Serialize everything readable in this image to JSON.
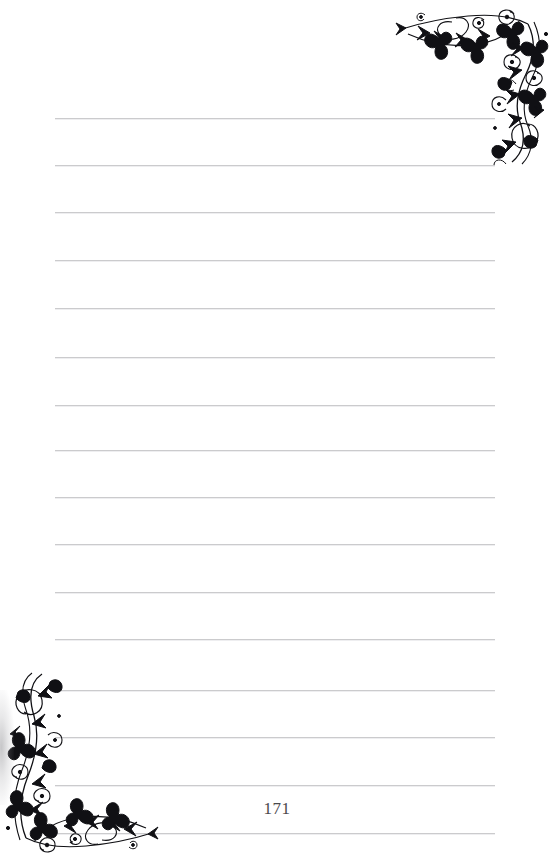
{
  "page": {
    "width": 554,
    "height": 862,
    "background_color": "#ffffff",
    "kind": "lined-notebook-page",
    "page_number": "171"
  },
  "rules": {
    "count": 16,
    "color": "#c9c9cb",
    "x_start": 55,
    "x_end": 495,
    "thickness": 1,
    "spacing": 47,
    "y_positions": [
      118,
      165,
      212,
      260,
      308,
      357,
      405,
      450,
      497,
      544,
      592,
      639,
      690,
      737,
      785,
      833
    ]
  },
  "ornaments": [
    {
      "name": "floral-corner-top-right",
      "position": "top-right",
      "color": "#101014",
      "description": "black filigree vine with spirals, curled tendrils and arrow-shaped leaves"
    },
    {
      "name": "floral-corner-bottom-left",
      "position": "bottom-left",
      "color": "#101014",
      "description": "mirrored black filigree vine with spirals, curled tendrils and arrow-shaped leaves"
    }
  ]
}
